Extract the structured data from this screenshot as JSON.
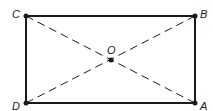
{
  "diagram": {
    "type": "rectangle-with-diagonals",
    "canvas": {
      "width": 213,
      "height": 111
    },
    "colors": {
      "stroke": "#1a1a1a",
      "background": "#ffffff"
    },
    "points": {
      "C": {
        "label": "C",
        "x": 26,
        "y": 16
      },
      "B": {
        "label": "B",
        "x": 195,
        "y": 16
      },
      "D": {
        "label": "D",
        "x": 26,
        "y": 103
      },
      "A": {
        "label": "A",
        "x": 195,
        "y": 103
      },
      "O": {
        "label": "O",
        "x": 111,
        "y": 60
      }
    },
    "sides": [
      {
        "from": "C",
        "to": "B",
        "style": "solid"
      },
      {
        "from": "B",
        "to": "A",
        "style": "solid"
      },
      {
        "from": "A",
        "to": "D",
        "style": "solid"
      },
      {
        "from": "D",
        "to": "C",
        "style": "solid"
      }
    ],
    "diagonals": [
      {
        "from": "C",
        "to": "A",
        "style": "dashed"
      },
      {
        "from": "D",
        "to": "B",
        "style": "dashed"
      }
    ],
    "intersection": "O"
  }
}
